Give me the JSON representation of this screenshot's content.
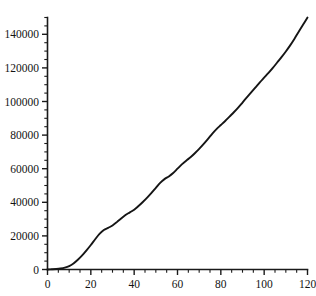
{
  "chart_data": {
    "type": "line",
    "title": "",
    "subtitle": "",
    "xlabel": "",
    "ylabel": "",
    "xlim": [
      0,
      120
    ],
    "ylim": [
      0,
      150000
    ],
    "grid": false,
    "legend": null,
    "x_ticks_major": [
      0,
      20,
      40,
      60,
      80,
      100,
      120
    ],
    "x_tick_labels": [
      "0",
      "20",
      "40",
      "60",
      "80",
      "100",
      "120"
    ],
    "x_minor_step": 5,
    "y_ticks_major": [
      0,
      20000,
      40000,
      60000,
      80000,
      100000,
      120000,
      140000
    ],
    "y_tick_labels": [
      "0",
      "20000",
      "40000",
      "60000",
      "80000",
      "100000",
      "120000",
      "140000"
    ],
    "y_minor_step": 5000,
    "series": [
      {
        "name": "cumulative",
        "color": "#151515",
        "x": [
          0,
          2,
          4,
          6,
          8,
          10,
          12,
          14,
          16,
          18,
          20,
          22,
          24,
          26,
          28,
          30,
          32,
          34,
          36,
          38,
          40,
          42,
          44,
          46,
          48,
          50,
          52,
          54,
          56,
          58,
          60,
          62,
          64,
          66,
          68,
          70,
          72,
          74,
          76,
          78,
          80,
          82,
          84,
          86,
          88,
          90,
          92,
          94,
          96,
          98,
          100,
          102,
          104,
          106,
          108,
          110,
          112,
          114,
          116,
          118,
          120
        ],
        "values": [
          0,
          120,
          300,
          600,
          1100,
          2000,
          3600,
          5800,
          8400,
          11400,
          14600,
          18000,
          21200,
          23500,
          24800,
          26200,
          28200,
          30400,
          32400,
          34000,
          35600,
          37800,
          40200,
          42800,
          45600,
          48600,
          51600,
          53800,
          55400,
          57400,
          60000,
          62600,
          64800,
          66800,
          69200,
          71800,
          74600,
          77600,
          80800,
          83600,
          86000,
          88400,
          91000,
          93600,
          96400,
          99400,
          102400,
          105400,
          108400,
          111400,
          114200,
          117000,
          120000,
          123200,
          126400,
          129800,
          133400,
          137400,
          141600,
          145800,
          150000
        ]
      }
    ]
  },
  "axes": {
    "x_axis_name": "x-axis",
    "y_axis_name": "y-axis"
  }
}
